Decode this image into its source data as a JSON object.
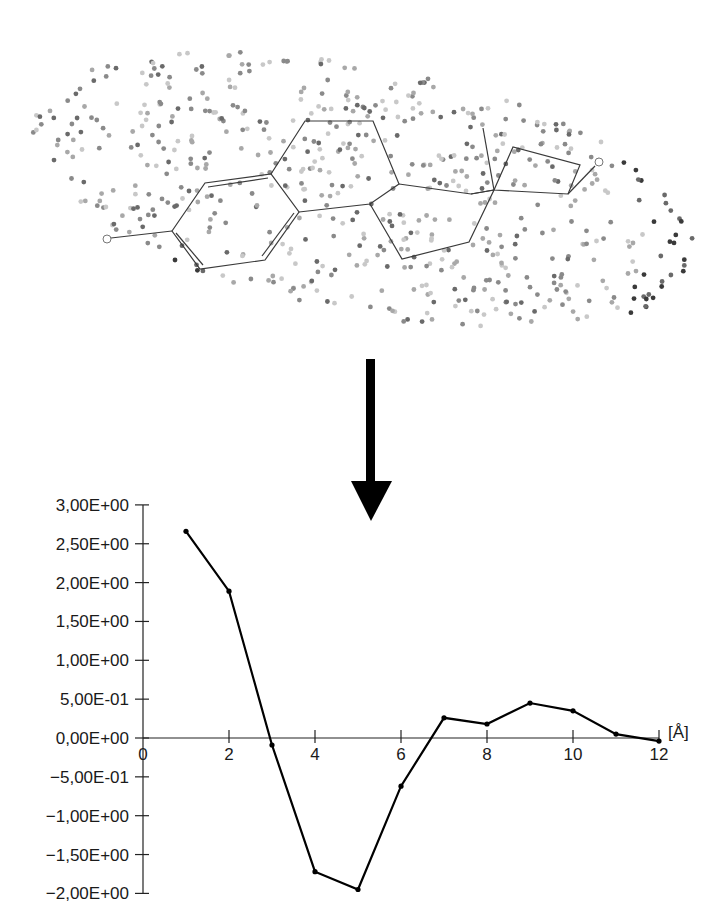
{
  "figure": {
    "molecule": {
      "atoms_labeled": [
        "O",
        "O"
      ],
      "point_colors": [
        "#c8c8c8",
        "#a8a8a8",
        "#8a8a8a",
        "#6a6a6a",
        "#3a3a3a"
      ]
    },
    "arrow": {
      "direction": "down",
      "color": "#000000"
    }
  },
  "chart_data": {
    "type": "line",
    "title": "",
    "xlabel": "[Å]",
    "ylabel": "",
    "x": [
      1,
      2,
      3,
      4,
      5,
      6,
      7,
      8,
      9,
      10,
      11,
      12
    ],
    "series": [
      {
        "name": "autocorrelation",
        "values": [
          2.66,
          1.89,
          -0.09,
          -1.72,
          -1.95,
          -0.62,
          0.26,
          0.18,
          0.45,
          0.35,
          0.05,
          -0.04
        ]
      }
    ],
    "xlim": [
      0,
      12
    ],
    "ylim": [
      -2.0,
      3.0
    ],
    "x_ticks": [
      "0",
      "2",
      "4",
      "6",
      "8",
      "10",
      "12"
    ],
    "y_ticks": [
      "3,00E+00",
      "2,50E+00",
      "2,00E+00",
      "1,50E+00",
      "1,00E+00",
      "5,00E-01",
      "0,00E+00",
      "-5,00E-01",
      "-1,00E+00",
      "-1,50E+00",
      "-2,00E+00"
    ],
    "grid": false,
    "legend": "none",
    "x_unit_label": "[Å]"
  }
}
